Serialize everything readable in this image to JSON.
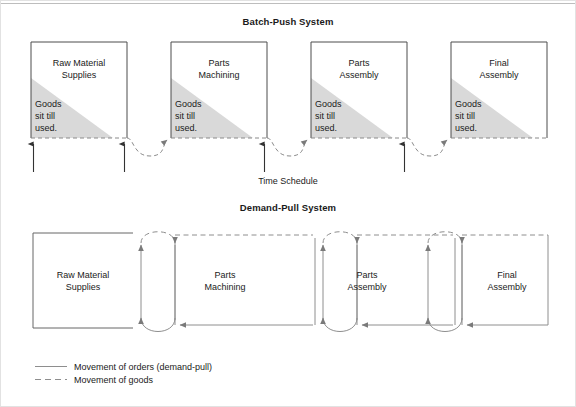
{
  "diagram": {
    "top_section": {
      "title": "Batch-Push System",
      "schedule_label": "Time Schedule",
      "stage_note": "Goods\nsit till\nused.",
      "note_lines": [
        "Goods",
        "sit till",
        "used."
      ],
      "stages": [
        {
          "line1": "Raw Material",
          "line2": "Supplies"
        },
        {
          "line1": "Parts",
          "line2": "Machining"
        },
        {
          "line1": "Parts",
          "line2": "Assembly"
        },
        {
          "line1": "Final",
          "line2": "Assembly"
        }
      ]
    },
    "bottom_section": {
      "title": "Demand-Pull System",
      "stages": [
        {
          "line1": "Raw Material",
          "line2": "Supplies"
        },
        {
          "line1": "Parts",
          "line2": "Machining"
        },
        {
          "line1": "Parts",
          "line2": "Assembly"
        },
        {
          "line1": "Final",
          "line2": "Assembly"
        }
      ]
    },
    "legend": [
      {
        "style": "solid",
        "label": "Movement of orders (demand-pull)"
      },
      {
        "style": "dashed",
        "label": "Movement of goods"
      }
    ],
    "colors": {
      "ink": "#1a1a1a",
      "stroke": "#555555",
      "inventory_fill": "#d9d9d9",
      "page_border": "#cccccc"
    }
  }
}
